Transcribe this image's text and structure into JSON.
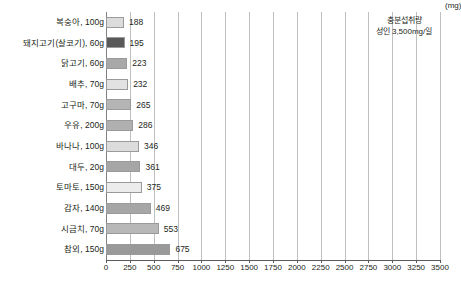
{
  "chart_data": {
    "type": "bar",
    "orientation": "horizontal",
    "title": "",
    "xlabel": "(mg)",
    "ylabel": "",
    "xlim": [
      0,
      3500
    ],
    "xticks": [
      0,
      250,
      500,
      750,
      1000,
      1250,
      1500,
      1750,
      2000,
      2250,
      2500,
      2750,
      3000,
      3250,
      3500
    ],
    "xtick_labels": [
      "0",
      "250",
      "500",
      "750",
      "1000",
      "1250",
      "1500",
      "1750",
      "2000",
      "2250",
      "2500",
      "2750",
      "3000",
      "3250",
      "3500"
    ],
    "unit_label": "(mg)",
    "grid": true,
    "legend": false,
    "categories": [
      "복숭아, 100g",
      "돼지고기(살코기), 60g",
      "닭고기, 60g",
      "배추, 70g",
      "고구마, 70g",
      "우유, 200g",
      "바나나, 100g",
      "대두, 20g",
      "토마토, 150g",
      "감자, 140g",
      "시금치, 70g",
      "참외, 150g"
    ],
    "values": [
      188,
      195,
      223,
      232,
      265,
      286,
      346,
      361,
      375,
      469,
      553,
      675
    ],
    "bar_colors": [
      "#dcdcdc",
      "#595959",
      "#a8a8a8",
      "#e2e2e2",
      "#b5b5b5",
      "#b0b0b0",
      "#dcdcdc",
      "#a6a6a6",
      "#ececec",
      "#a6a6a6",
      "#b8b8b8",
      "#999999"
    ],
    "annotations": [
      {
        "line1": "충분섭취량",
        "line2": "성인 3,500mg/일"
      }
    ]
  }
}
